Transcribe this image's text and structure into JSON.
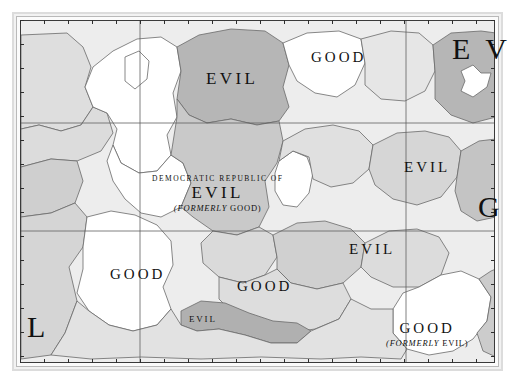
{
  "figure": {
    "kind": "political-map",
    "caption": "",
    "palette": {
      "paper": "#ffffff",
      "frame_outer": "#dcdcdc",
      "frame_inner": "#3a3a3a",
      "ink": "#111111",
      "border_line": "#6a6a6a",
      "graticule": "#5b5b5b",
      "fill_white": "#ffffff",
      "fill_light": "#e4e4e4",
      "fill_mid": "#d2d2d2",
      "fill_dark": "#b4b4b4",
      "fill_darkest": "#9e9e9e"
    },
    "graticule": {
      "vertical_x": [
        139,
        405
      ],
      "horizontal_y": [
        122,
        230
      ]
    }
  },
  "labels": [
    {
      "id": "evil-north",
      "prefix": "",
      "name": "EVIL",
      "suffix": "",
      "x": 206,
      "y": 70,
      "size": "big"
    },
    {
      "id": "good-north",
      "prefix": "",
      "name": "GOOD",
      "suffix": "",
      "x": 311,
      "y": 48,
      "size": "normal"
    },
    {
      "id": "dr-evil",
      "prefix": "DEMOCRATIC REPUBLIC OF",
      "name": "EVIL",
      "suffix": "(FORMERLY GOOD)",
      "x": 196,
      "y": 180,
      "size": "big"
    },
    {
      "id": "evil-east",
      "prefix": "",
      "name": "EVIL",
      "suffix": "",
      "x": 404,
      "y": 158,
      "size": "normal"
    },
    {
      "id": "evil-central",
      "prefix": "",
      "name": "EVIL",
      "suffix": "",
      "x": 349,
      "y": 240,
      "size": "normal"
    },
    {
      "id": "good-west",
      "prefix": "",
      "name": "GOOD",
      "suffix": "",
      "x": 110,
      "y": 265,
      "size": "normal"
    },
    {
      "id": "good-south",
      "prefix": "",
      "name": "GOOD",
      "suffix": "",
      "x": 237,
      "y": 277,
      "size": "normal"
    },
    {
      "id": "evil-southsliver",
      "prefix": "",
      "name": "EVIL",
      "suffix": "",
      "x": 189,
      "y": 308,
      "size": "small"
    },
    {
      "id": "good-formerly-evil",
      "prefix": "",
      "name": "GOOD",
      "suffix": "(FORMERLY EVIL)",
      "x": 427,
      "y": 325,
      "size": "normal"
    }
  ],
  "edge_letters": [
    {
      "id": "edge-ev-topright",
      "text": "E V",
      "x": 452,
      "y": 32
    },
    {
      "id": "edge-g-right",
      "text": "G",
      "x": 478,
      "y": 190
    },
    {
      "id": "edge-l-bottomleft",
      "text": "L",
      "x": 27,
      "y": 310
    }
  ]
}
